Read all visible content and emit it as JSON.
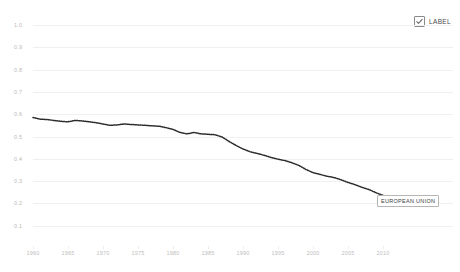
{
  "legend": {
    "checkbox_icon": "checkbox-checked-icon",
    "checked": true,
    "label": "LABEL"
  },
  "annotation": {
    "text": "EUROPEAN UNION"
  },
  "colors": {
    "series": "#2b2b2b",
    "grid": "#f0f0f0",
    "tick_text": "#bdbdbd",
    "background": "#ffffff",
    "annotation_border": "#b5b5b5"
  },
  "chart_data": {
    "type": "line",
    "title": "",
    "subtitle": "",
    "xlabel": "",
    "ylabel": "",
    "grid": true,
    "legend_position": "top-right",
    "xlim": [
      1960,
      2014
    ],
    "ylim": [
      0.0,
      1.0
    ],
    "ytick_labels": [
      "1.0",
      "0.9",
      "0.8",
      "0.7",
      "0.6",
      "0.5",
      "0.4",
      "0.3",
      "0.2",
      "0.1",
      "0.0"
    ],
    "ytick_values": [
      1.0,
      0.9,
      0.8,
      0.7,
      0.6,
      0.5,
      0.4,
      0.3,
      0.2,
      0.1,
      0.0
    ],
    "xtick_labels": [
      "1960",
      "1965",
      "1970",
      "1975",
      "1980",
      "1985",
      "1990",
      "1995",
      "2000",
      "2005",
      "2010"
    ],
    "xtick_values": [
      1960,
      1965,
      1970,
      1975,
      1980,
      1985,
      1990,
      1995,
      2000,
      2005,
      2010
    ],
    "series": [
      {
        "name": "EUROPEAN UNION",
        "style": "dotted",
        "color": "#2b2b2b",
        "x": [
          1960,
          1961,
          1962,
          1963,
          1964,
          1965,
          1966,
          1967,
          1968,
          1969,
          1970,
          1971,
          1972,
          1973,
          1974,
          1975,
          1976,
          1977,
          1978,
          1979,
          1980,
          1981,
          1982,
          1983,
          1984,
          1985,
          1986,
          1987,
          1988,
          1989,
          1990,
          1991,
          1992,
          1993,
          1994,
          1995,
          1996,
          1997,
          1998,
          1999,
          2000,
          2001,
          2002,
          2003,
          2004,
          2005,
          2006,
          2007,
          2008,
          2009,
          2010,
          2011,
          2012,
          2013
        ],
        "values": [
          0.585,
          0.578,
          0.576,
          0.572,
          0.568,
          0.566,
          0.572,
          0.57,
          0.566,
          0.562,
          0.556,
          0.55,
          0.552,
          0.556,
          0.554,
          0.552,
          0.55,
          0.548,
          0.546,
          0.54,
          0.532,
          0.518,
          0.512,
          0.518,
          0.512,
          0.51,
          0.508,
          0.498,
          0.478,
          0.46,
          0.444,
          0.432,
          0.424,
          0.416,
          0.406,
          0.398,
          0.392,
          0.382,
          0.37,
          0.352,
          0.338,
          0.33,
          0.322,
          0.316,
          0.306,
          0.294,
          0.284,
          0.272,
          0.262,
          0.248,
          0.236,
          0.224,
          0.208,
          0.19
        ]
      }
    ],
    "annotations": [
      {
        "text": "EUROPEAN UNION",
        "x": 2012,
        "y": 0.22
      }
    ]
  }
}
